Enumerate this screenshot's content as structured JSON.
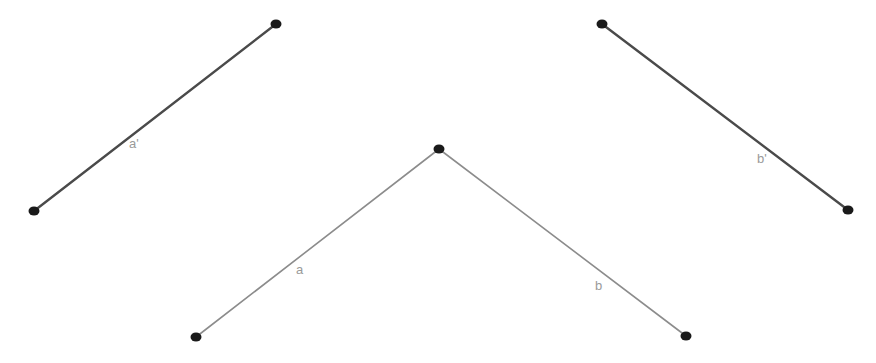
{
  "diagram": {
    "segments": [
      {
        "id": "a-prime",
        "label": "a'",
        "start": {
          "x": 34,
          "y": 211
        },
        "end": {
          "x": 276,
          "y": 24
        },
        "label_pos": {
          "x": 129,
          "y": 148
        },
        "stroke": "#4a4a4a",
        "stroke_width": 2.4
      },
      {
        "id": "b-prime",
        "label": "b'",
        "start": {
          "x": 602,
          "y": 24
        },
        "end": {
          "x": 848,
          "y": 210
        },
        "label_pos": {
          "x": 757,
          "y": 163
        },
        "stroke": "#4a4a4a",
        "stroke_width": 2.4
      },
      {
        "id": "a",
        "label": "a",
        "start": {
          "x": 196,
          "y": 337
        },
        "end": {
          "x": 439,
          "y": 149
        },
        "label_pos": {
          "x": 296,
          "y": 274
        },
        "stroke": "#8c8c8c",
        "stroke_width": 1.6
      },
      {
        "id": "b",
        "label": "b",
        "start": {
          "x": 439,
          "y": 149
        },
        "end": {
          "x": 686,
          "y": 336
        },
        "label_pos": {
          "x": 595,
          "y": 290
        },
        "stroke": "#8c8c8c",
        "stroke_width": 1.6
      }
    ],
    "points": [
      {
        "id": "a-prime-start",
        "x": 34,
        "y": 211
      },
      {
        "id": "a-prime-end",
        "x": 276,
        "y": 24
      },
      {
        "id": "b-prime-start",
        "x": 602,
        "y": 24
      },
      {
        "id": "b-prime-end",
        "x": 848,
        "y": 210
      },
      {
        "id": "a-start",
        "x": 196,
        "y": 337
      },
      {
        "id": "vertex",
        "x": 439,
        "y": 149
      },
      {
        "id": "b-end",
        "x": 686,
        "y": 336
      }
    ],
    "point_color": "#1a1a1a",
    "point_radius": 5,
    "label_color": "#9a9a9a"
  }
}
